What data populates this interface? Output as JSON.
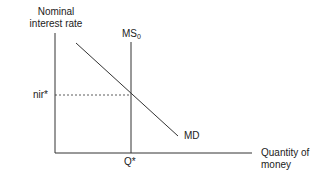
{
  "diagram": {
    "type": "money market equilibrium",
    "y_axis_label_line1": "Nominal",
    "y_axis_label_line2": "interest rate",
    "x_axis_label_line1": "Quantity of",
    "x_axis_label_line2": "money",
    "supply_curve_label": "MS",
    "supply_curve_subscript": "0",
    "demand_curve_label": "MD",
    "equilibrium_rate_label": "nir*",
    "equilibrium_quantity_label": "Q*",
    "colors": {
      "line": "#333333",
      "background": "#ffffff"
    }
  }
}
